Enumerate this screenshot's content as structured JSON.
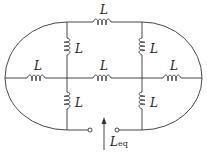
{
  "diagram": {
    "type": "inductor network",
    "inductor_label": "L",
    "output_label": "L",
    "output_subscript": "eq",
    "inductors": [
      {
        "id": "top",
        "label": "L",
        "orientation": "horizontal"
      },
      {
        "id": "upper-left-vertical",
        "label": "L",
        "orientation": "vertical"
      },
      {
        "id": "upper-right-vertical",
        "label": "L",
        "orientation": "vertical"
      },
      {
        "id": "middle-left",
        "label": "L",
        "orientation": "horizontal"
      },
      {
        "id": "middle-center",
        "label": "L",
        "orientation": "horizontal"
      },
      {
        "id": "middle-right",
        "label": "L",
        "orientation": "horizontal"
      },
      {
        "id": "lower-left-vertical",
        "label": "L",
        "orientation": "vertical"
      },
      {
        "id": "lower-right-vertical",
        "label": "L",
        "orientation": "vertical"
      }
    ],
    "terminals": 2,
    "line_color": "#333333"
  }
}
